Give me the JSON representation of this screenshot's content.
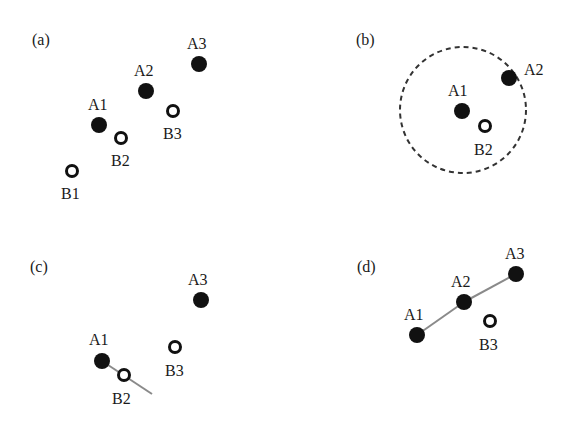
{
  "panels": [
    {
      "id": "a",
      "label": "(a)",
      "label_pos": [
        32,
        45
      ],
      "filled_points": [
        {
          "name": "A1",
          "x": 99,
          "y": 125,
          "lx": 88,
          "ly": 110
        },
        {
          "name": "A2",
          "x": 146,
          "y": 91,
          "lx": 134,
          "ly": 76
        },
        {
          "name": "A3",
          "x": 199,
          "y": 64,
          "lx": 187,
          "ly": 49
        }
      ],
      "open_points": [
        {
          "name": "B1",
          "x": 72,
          "y": 171,
          "lx": 61,
          "ly": 199
        },
        {
          "name": "B2",
          "x": 121,
          "y": 138,
          "lx": 111,
          "ly": 166
        },
        {
          "name": "B3",
          "x": 173,
          "y": 111,
          "lx": 163,
          "ly": 139
        }
      ],
      "lines": [],
      "circles": []
    },
    {
      "id": "b",
      "label": "(b)",
      "label_pos": [
        356,
        45
      ],
      "filled_points": [
        {
          "name": "A1",
          "x": 462,
          "y": 111,
          "lx": 448,
          "ly": 96
        },
        {
          "name": "A2",
          "x": 509,
          "y": 78,
          "lx": 524,
          "ly": 75
        }
      ],
      "open_points": [
        {
          "name": "B2",
          "x": 485,
          "y": 126,
          "lx": 474,
          "ly": 155
        }
      ],
      "lines": [],
      "circles": [
        {
          "cx": 463,
          "cy": 110,
          "r": 63,
          "style": "dashed"
        }
      ]
    },
    {
      "id": "c",
      "label": "(c)",
      "label_pos": [
        30,
        272
      ],
      "filled_points": [
        {
          "name": "A1",
          "x": 102,
          "y": 361,
          "lx": 89,
          "ly": 345
        },
        {
          "name": "A3",
          "x": 201,
          "y": 300,
          "lx": 188,
          "ly": 285
        }
      ],
      "open_points": [
        {
          "name": "B2",
          "x": 124,
          "y": 375,
          "lx": 112,
          "ly": 404
        },
        {
          "name": "B3",
          "x": 175,
          "y": 347,
          "lx": 165,
          "ly": 376
        }
      ],
      "lines": [
        {
          "x1": 102,
          "y1": 361,
          "x2": 152,
          "y2": 394
        }
      ],
      "circles": []
    },
    {
      "id": "d",
      "label": "(d)",
      "label_pos": [
        357,
        272
      ],
      "filled_points": [
        {
          "name": "A1",
          "x": 417,
          "y": 335,
          "lx": 404,
          "ly": 320
        },
        {
          "name": "A2",
          "x": 464,
          "y": 302,
          "lx": 451,
          "ly": 287
        },
        {
          "name": "A3",
          "x": 516,
          "y": 274,
          "lx": 505,
          "ly": 259
        }
      ],
      "open_points": [
        {
          "name": "B3",
          "x": 490,
          "y": 321,
          "lx": 479,
          "ly": 350
        }
      ],
      "lines": [
        {
          "x1": 417,
          "y1": 335,
          "x2": 464,
          "y2": 302
        },
        {
          "x1": 464,
          "y1": 302,
          "x2": 516,
          "y2": 274
        }
      ],
      "circles": []
    }
  ],
  "style": {
    "point_color": "#111111",
    "line_color": "#8a8a8a",
    "circle_color": "#333333",
    "filled_radius": 8,
    "open_radius": 5.5
  }
}
